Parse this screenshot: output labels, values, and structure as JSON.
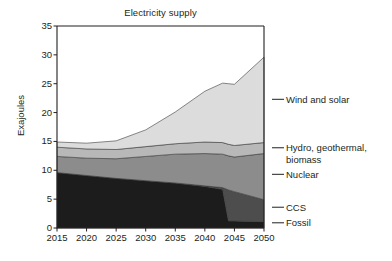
{
  "chart": {
    "title": "Electricity supply",
    "ylabel": "Exajoules"
  },
  "chart_data": {
    "type": "area",
    "title": "Electricity supply",
    "xlabel": "",
    "ylabel": "Exajoules",
    "stacked": true,
    "grid": false,
    "legend_position": "right",
    "xlim": [
      2015,
      2050
    ],
    "ylim": [
      0,
      35
    ],
    "yticks": [
      0,
      5,
      10,
      15,
      20,
      25,
      30,
      35
    ],
    "xticks": [
      2015,
      2020,
      2025,
      2030,
      2035,
      2040,
      2045,
      2050
    ],
    "x": [
      2015,
      2020,
      2025,
      2030,
      2035,
      2040,
      2043,
      2044,
      2045,
      2050
    ],
    "series": [
      {
        "name": "Fossil",
        "color": "#1c1c1c",
        "values": [
          9.6,
          9.1,
          8.6,
          8.2,
          7.8,
          7.2,
          6.7,
          1.2,
          1.2,
          1.1
        ]
      },
      {
        "name": "CCS",
        "color": "#4d4d4d",
        "values": [
          0.0,
          0.0,
          0.0,
          0.0,
          0.0,
          0.1,
          0.3,
          5.4,
          5.1,
          3.8
        ]
      },
      {
        "name": "Nuclear",
        "color": "#8c8c8c",
        "values": [
          2.8,
          3.0,
          3.4,
          4.2,
          5.0,
          5.6,
          5.8,
          5.9,
          6.0,
          8.0
        ]
      },
      {
        "name": "Hydro, geothermal, biomass",
        "color": "#b8b8b8",
        "values": [
          1.6,
          1.6,
          1.6,
          1.7,
          1.8,
          2.0,
          2.0,
          2.0,
          2.0,
          1.9
        ]
      },
      {
        "name": "Wind and solar",
        "color": "#dcdcdc",
        "values": [
          0.9,
          1.0,
          1.5,
          2.9,
          5.5,
          8.8,
          10.3,
          10.5,
          10.6,
          14.8
        ]
      }
    ],
    "totals": [
      14.9,
      14.7,
      15.1,
      17.0,
      20.1,
      23.7,
      25.1,
      25.0,
      24.9,
      29.6
    ],
    "annotations": [
      {
        "label": "Wind and solar",
        "y": 22.3
      },
      {
        "label": "Hydro, geothermal,\nbiomass",
        "y": 13.9
      },
      {
        "label": "Nuclear",
        "y": 9.3
      },
      {
        "label": "CCS",
        "y": 3.6
      },
      {
        "label": "Fossil",
        "y": 0.9
      }
    ]
  }
}
